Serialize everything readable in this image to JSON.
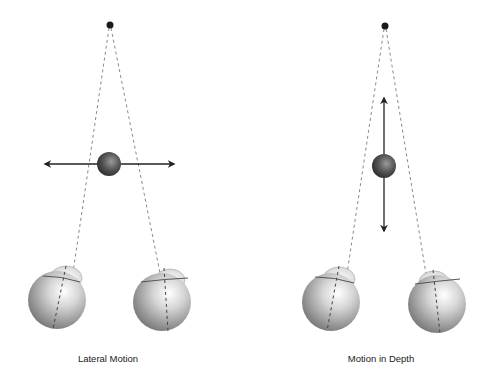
{
  "panels": [
    {
      "id": "lateral",
      "label": "Lateral Motion",
      "fixation_point": {
        "x": 110,
        "y": 25
      },
      "object": {
        "x": 109,
        "y": 164,
        "r": 12
      },
      "arrow": {
        "orientation": "horizontal",
        "x1": 43,
        "y1": 164,
        "x2": 176,
        "y2": 164
      },
      "eyes": [
        {
          "cx": 57,
          "cy": 300,
          "r": 29,
          "cornea_x": 66,
          "cornea_y": 277
        },
        {
          "cx": 162,
          "cy": 302,
          "r": 29,
          "cornea_x": 170,
          "cornea_y": 280
        }
      ]
    },
    {
      "id": "depth",
      "label": "Motion in Depth",
      "fixation_point": {
        "x": 385,
        "y": 26
      },
      "object": {
        "x": 384,
        "y": 166,
        "r": 12
      },
      "arrow": {
        "orientation": "vertical",
        "x1": 384,
        "y1": 96,
        "x2": 384,
        "y2": 233
      },
      "eyes": [
        {
          "cx": 331,
          "cy": 302,
          "r": 29,
          "cornea_x": 339,
          "cornea_y": 279
        },
        {
          "cx": 437,
          "cy": 304,
          "r": 29,
          "cornea_x": 434,
          "cornea_y": 282
        }
      ]
    }
  ],
  "colors": {
    "line": "#222222",
    "dashed": "#888888",
    "ball_dark": "#2e2e2e",
    "ball_light": "#8a8a8a",
    "eye_light": "#f4f4f4",
    "eye_dark": "#6a6a6a"
  }
}
